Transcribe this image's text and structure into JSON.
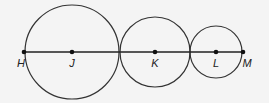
{
  "diagram": {
    "points": [
      {
        "id": "H",
        "label": "H",
        "x": 24,
        "y": 52,
        "lx": 22,
        "ly": 57
      },
      {
        "id": "J",
        "label": "J",
        "x": 72,
        "y": 52,
        "lx": 72,
        "ly": 57
      },
      {
        "id": "K",
        "label": "K",
        "x": 155,
        "y": 52,
        "lx": 155,
        "ly": 57
      },
      {
        "id": "L",
        "label": "L",
        "x": 216,
        "y": 52,
        "lx": 216,
        "ly": 57
      },
      {
        "id": "M",
        "label": "M",
        "x": 243,
        "y": 52,
        "lx": 248,
        "ly": 57
      }
    ],
    "circles": [
      {
        "center": "J",
        "cx": 72,
        "cy": 52,
        "r": 47
      },
      {
        "center": "K",
        "cx": 155,
        "cy": 52,
        "r": 35
      },
      {
        "center": "L",
        "cx": 216,
        "cy": 52,
        "r": 26
      }
    ],
    "segment": {
      "from": "H",
      "to": "M"
    },
    "stroke_color": "#333333"
  }
}
